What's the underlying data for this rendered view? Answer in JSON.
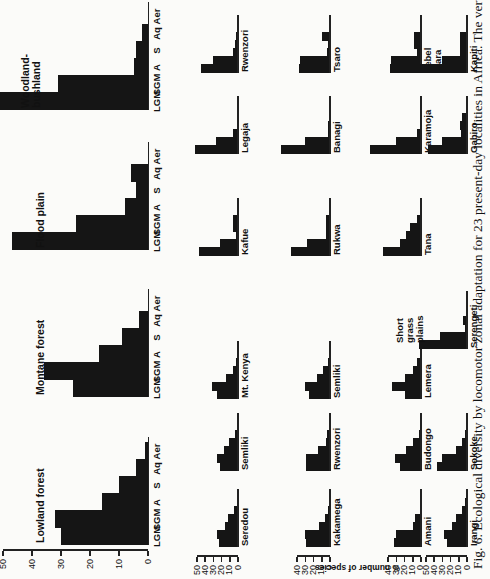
{
  "chart_data": {
    "type": "bar",
    "title": "Ecological diversity by locomotor zonal adaptation for 23 present-day localities in Africa",
    "ylabel": "% number of species",
    "categories": [
      "LGM",
      "SGM",
      "A",
      "S",
      "Aq",
      "Aer"
    ],
    "ylim": [
      0,
      50
    ],
    "yticks": [
      0,
      10,
      20,
      30,
      40,
      50
    ],
    "habitats": [
      {
        "name": "Lowland forest",
        "values": [
          30,
          32,
          16,
          10,
          4,
          1
        ]
      },
      {
        "name": "Montane forest",
        "values": [
          26,
          36,
          17,
          9,
          3,
          0
        ]
      },
      {
        "name": "Flood plain",
        "values": [
          47,
          25,
          8,
          4,
          6,
          0
        ]
      },
      {
        "name": "Woodland-bushland",
        "values": [
          52,
          31,
          5,
          4,
          2,
          0
        ]
      }
    ],
    "localities": [
      {
        "name": "Seredou",
        "habitat": "Lowland forest",
        "values": [
          23,
          25,
          16,
          12,
          5,
          1
        ]
      },
      {
        "name": "Kakamega",
        "habitat": "Lowland forest",
        "values": [
          29,
          30,
          14,
          6,
          2,
          1
        ]
      },
      {
        "name": "Amani",
        "habitat": "Lowland forest",
        "values": [
          33,
          31,
          10,
          7,
          1,
          0
        ]
      },
      {
        "name": "Irangi",
        "habitat": "Lowland forest",
        "values": [
          24,
          28,
          18,
          13,
          6,
          2
        ]
      },
      {
        "name": "Semliki",
        "habitat": "Lowland forest",
        "values": [
          22,
          26,
          17,
          11,
          4,
          0
        ]
      },
      {
        "name": "Rwenzori",
        "habitat": "Lowland forest",
        "values": [
          29,
          29,
          15,
          5,
          4,
          0
        ]
      },
      {
        "name": "Budongo",
        "habitat": "Lowland forest",
        "values": [
          25,
          32,
          18,
          10,
          3,
          0
        ]
      },
      {
        "name": "Sokoke",
        "habitat": "Lowland forest",
        "values": [
          36,
          30,
          13,
          6,
          3,
          0
        ]
      },
      {
        "name": "Mt. Kenya",
        "habitat": "Montane forest",
        "values": [
          26,
          32,
          15,
          6,
          2,
          0
        ]
      },
      {
        "name": "Semliki",
        "habitat": "Montane forest",
        "values": [
          26,
          30,
          16,
          9,
          3,
          0
        ]
      },
      {
        "name": "Lemera",
        "habitat": "Montane forest",
        "values": [
          20,
          35,
          20,
          10,
          5,
          0
        ]
      },
      {
        "name": "Kafue",
        "habitat": "Flood plain",
        "values": [
          47,
          22,
          2,
          6,
          6,
          0
        ]
      },
      {
        "name": "Rukwa",
        "habitat": "Flood plain",
        "values": [
          47,
          28,
          5,
          5,
          5,
          0
        ]
      },
      {
        "name": "Tana",
        "habitat": "Flood plain",
        "values": [
          46,
          25,
          18,
          13,
          5,
          0
        ]
      },
      {
        "name": "Serengeti",
        "habitat": "Short grass plains",
        "values": [
          58,
          33,
          2,
          5,
          1,
          0
        ]
      },
      {
        "name": "Legaja",
        "habitat": "Woodland-bushland",
        "values": [
          52,
          27,
          6,
          1,
          0,
          0
        ]
      },
      {
        "name": "Banagi",
        "habitat": "Woodland-bushland",
        "values": [
          60,
          30,
          3,
          2,
          1,
          0
        ]
      },
      {
        "name": "Karamoja",
        "habitat": "Woodland-bushland",
        "values": [
          62,
          30,
          5,
          0,
          0,
          0
        ]
      },
      {
        "name": "Gabiro",
        "habitat": "Woodland-bushland",
        "values": [
          48,
          30,
          7,
          8,
          6,
          0
        ]
      },
      {
        "name": "Rwenzori",
        "habitat": "Woodland-bushland",
        "values": [
          45,
          31,
          6,
          4,
          3,
          0
        ]
      },
      {
        "name": "Tsaro",
        "habitat": "Woodland-bushland",
        "values": [
          38,
          36,
          4,
          3,
          10,
          0
        ]
      },
      {
        "name": "Jebel Mara",
        "habitat": "Woodland-bushland",
        "values": [
          38,
          37,
          5,
          9,
          9,
          0
        ]
      },
      {
        "name": "Kapiti",
        "habitat": "Woodland-bushland",
        "values": [
          58,
          30,
          8,
          8,
          8,
          0
        ]
      }
    ],
    "grid": false,
    "legend": "none"
  },
  "figure": {
    "caption": "Fig. 6. Ecological diversity by locomotor zonal adaptation for 23 present-day localities in Africa. The vertical scale",
    "y_axis_label": "% number of species",
    "short_grass_label": "Short grass plains"
  }
}
